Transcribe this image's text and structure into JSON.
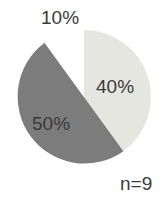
{
  "chart_data": {
    "type": "pie",
    "title": "",
    "categories": [
      "Light gray segment",
      "Dark gray segment",
      "White segment"
    ],
    "values": [
      40,
      50,
      10
    ],
    "labels": [
      "40%",
      "50%",
      "10%"
    ],
    "colors": [
      "#e6e6e1",
      "#7c7c7c",
      "#ffffff"
    ],
    "start_angle_deg": 0,
    "direction": "clockwise",
    "annotation": "n=9",
    "legend": "none"
  },
  "labels": {
    "slice_40": "40%",
    "slice_50": "50%",
    "slice_10": "10%",
    "sample_size": "n=9"
  }
}
